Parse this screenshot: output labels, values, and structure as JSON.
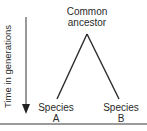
{
  "diagram": {
    "type": "phylogenetic-tree",
    "root": {
      "label_line1": "Common",
      "label_line2": "ancestor"
    },
    "leaves": [
      {
        "label_line1": "Species",
        "label_line2": "A"
      },
      {
        "label_line1": "Species",
        "label_line2": "B"
      }
    ],
    "axis": {
      "label": "Time in generations",
      "direction": "down"
    },
    "colors": {
      "line": "#2a2a2a",
      "text": "#2a2a2a",
      "rule": "#9a9a9a"
    }
  }
}
